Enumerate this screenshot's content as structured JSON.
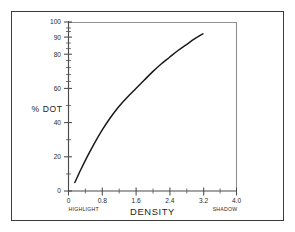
{
  "chart_data": {
    "type": "line",
    "title": "",
    "xlabel": "DENSITY",
    "ylabel": "% DOT",
    "xlim": [
      0,
      4.0
    ],
    "ylim": [
      0,
      100
    ],
    "grid": false,
    "legend": null,
    "x_tick_labels": [
      "0",
      "0.8",
      "1.6",
      "2.4",
      "3.2",
      "4.0"
    ],
    "x_tick_values": [
      0,
      0.8,
      1.6,
      2.4,
      3.2,
      4.0
    ],
    "y_tick_labels": [
      "0",
      "20",
      "40",
      "60",
      "80",
      "90",
      "100"
    ],
    "y_tick_values": [
      0,
      20,
      40,
      60,
      80,
      90,
      100
    ],
    "annotations": [
      {
        "text": "HIGHLIGHT",
        "position": "below-x-axis-left",
        "x": 0
      },
      {
        "text": "SHADOW",
        "position": "below-x-axis-right",
        "x": 4.0
      }
    ],
    "series": [
      {
        "name": "% DOT vs DENSITY",
        "color": "#1a1a1a",
        "x": [
          0.15,
          0.3,
          0.45,
          0.6,
          0.8,
          1.0,
          1.2,
          1.4,
          1.6,
          1.8,
          2.0,
          2.2,
          2.4,
          2.6,
          2.8,
          3.0,
          3.2
        ],
        "y": [
          5,
          13,
          20.5,
          27.5,
          36,
          43.5,
          50,
          55.5,
          60.5,
          65.5,
          70.5,
          75,
          79,
          83,
          86.5,
          90,
          93
        ]
      }
    ]
  },
  "axes": {
    "x_title": "DENSITY",
    "y_title": "% DOT",
    "highlight_label": "HIGHLIGHT",
    "shadow_label": "SHADOW"
  },
  "colors": {
    "curve": "#1a1a1a",
    "axis": "#4a4a4a",
    "frame": "#8a8a8a",
    "outer_border": "#3b3b3b",
    "text": "#2a2a2a",
    "background": "#ffffff"
  }
}
